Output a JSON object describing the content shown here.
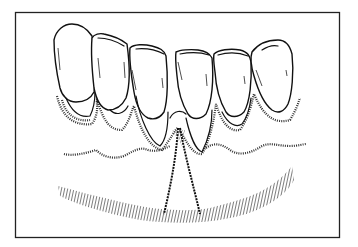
{
  "figure": {
    "type": "line-drawing",
    "colors": {
      "ink": "#111111",
      "background": "#ffffff",
      "frame": "#222222"
    },
    "frame": {
      "x": 15,
      "y": 12,
      "width": 325,
      "height": 226
    },
    "teeth_count": 6,
    "elements": [
      "teeth",
      "gingival-margin",
      "mucogingival-line",
      "vestibule-hatching",
      "frenum"
    ]
  }
}
